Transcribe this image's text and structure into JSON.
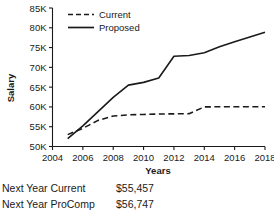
{
  "chart_data": {
    "type": "line",
    "title": "",
    "xlabel": "Years",
    "ylabel": "Salary",
    "xlim": [
      2004,
      2018
    ],
    "ylim": [
      50000,
      85000
    ],
    "grid": false,
    "legend_position": "top-left",
    "x_tick_labels": [
      "2004",
      "2006",
      "2008",
      "2010",
      "2012",
      "2014",
      "2016",
      "2018"
    ],
    "x_ticks": [
      2004,
      2006,
      2008,
      2010,
      2012,
      2014,
      2016,
      2018
    ],
    "y_tick_labels": [
      "50K",
      "55K",
      "60K",
      "65K",
      "70K",
      "75K",
      "80K",
      "85K"
    ],
    "y_ticks": [
      50000,
      55000,
      60000,
      65000,
      70000,
      75000,
      80000,
      85000
    ],
    "series": [
      {
        "name": "Current",
        "style": "dashed",
        "color": "#1a1a1a",
        "x": [
          2005,
          2006,
          2007,
          2008,
          2009,
          2010,
          2011,
          2012,
          2013,
          2014,
          2015,
          2016,
          2017,
          2018
        ],
        "values": [
          53000,
          54600,
          56600,
          57700,
          58000,
          58100,
          58200,
          58250,
          58300,
          60000,
          60050,
          60050,
          60050,
          60050
        ]
      },
      {
        "name": "Proposed",
        "style": "solid",
        "color": "#1a1a1a",
        "x": [
          2005,
          2006,
          2007,
          2008,
          2009,
          2010,
          2011,
          2012,
          2013,
          2014,
          2015,
          2016,
          2017,
          2018
        ],
        "values": [
          52000,
          55200,
          58800,
          62400,
          65500,
          66200,
          67300,
          72800,
          73000,
          73700,
          75200,
          76500,
          77700,
          78900
        ]
      }
    ]
  },
  "legend": {
    "items": [
      {
        "label": "Current"
      },
      {
        "label": "Proposed"
      }
    ]
  },
  "summary": {
    "rows": [
      {
        "label": "Next Year Current",
        "value": "$55,457"
      },
      {
        "label": "Next Year ProComp",
        "value": "$56,747"
      }
    ]
  }
}
